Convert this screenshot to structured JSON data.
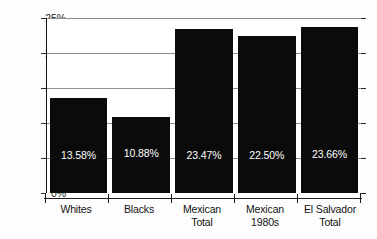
{
  "chart_data": {
    "type": "bar",
    "title": "",
    "subtitle": "",
    "xlabel": "",
    "ylabel": "",
    "ylim": [
      0,
      25
    ],
    "y_unit": "%",
    "grid": true,
    "legend": "none",
    "orientation": "vertical",
    "bar_color": "#0b0b0b",
    "value_label_color": "#ffffff",
    "categories": [
      "Whites",
      "Mexican Total",
      "Mexican 1980s",
      "El Salvador Total",
      "Blacks"
    ],
    "y_ticks": [
      "0%",
      "5%",
      "10%",
      "15%",
      "20%",
      "25%"
    ],
    "y_tick_values": [
      0,
      5,
      10,
      15,
      20,
      25
    ],
    "bars": [
      {
        "category": "Whites",
        "label_lines": [
          "Whites"
        ],
        "value": 13.58,
        "value_label": "13.58%"
      },
      {
        "category": "Blacks",
        "label_lines": [
          "Blacks"
        ],
        "value": 10.88,
        "value_label": "10.88%"
      },
      {
        "category": "Mexican Total",
        "label_lines": [
          "Mexican",
          "Total"
        ],
        "value": 23.47,
        "value_label": "23.47%"
      },
      {
        "category": "Mexican 1980s",
        "label_lines": [
          "Mexican",
          "1980s"
        ],
        "value": 22.5,
        "value_label": "22.50%"
      },
      {
        "category": "El Salvador Total",
        "label_lines": [
          "El Salvador",
          "Total"
        ],
        "value": 23.66,
        "value_label": "23.66%"
      }
    ],
    "values": [
      13.58,
      10.88,
      23.47,
      22.5,
      23.66
    ]
  }
}
